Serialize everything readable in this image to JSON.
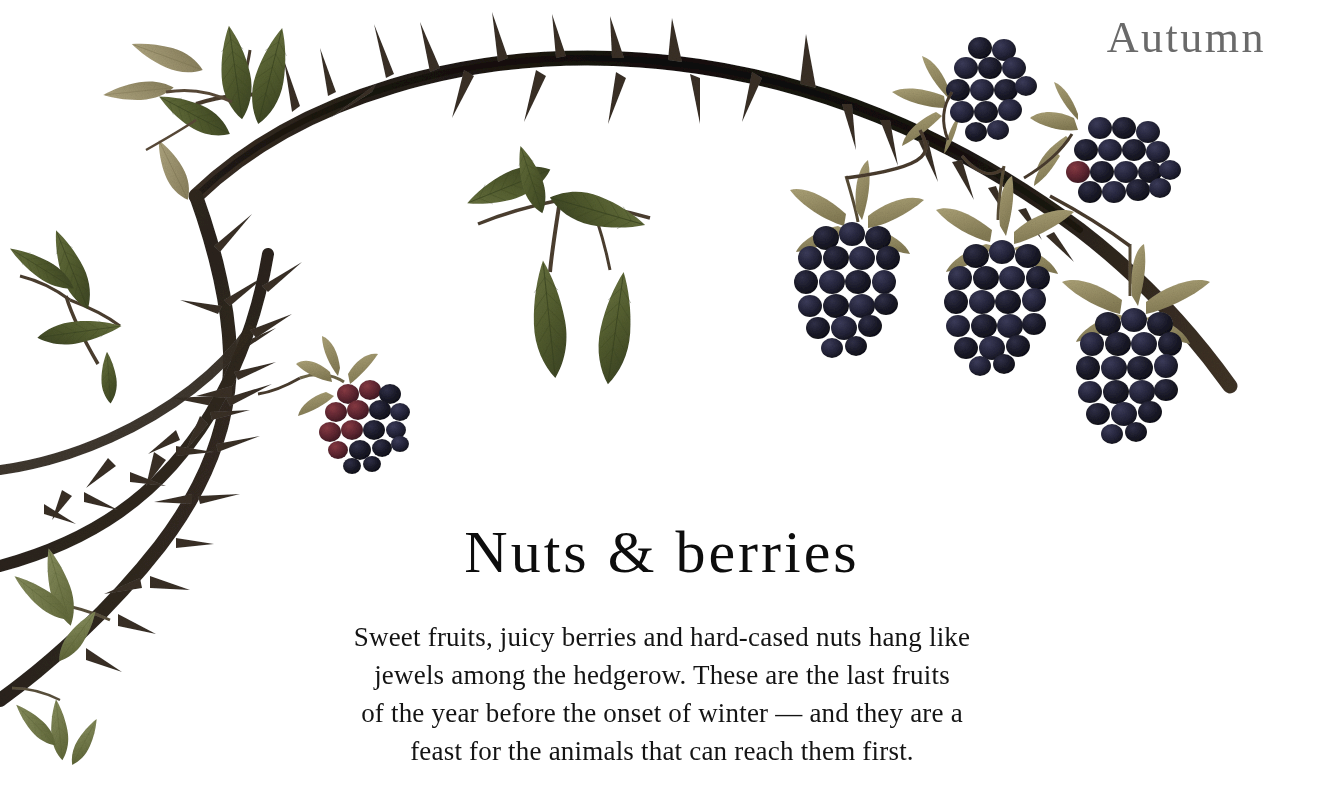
{
  "page": {
    "background_color": "#ffffff",
    "width": 1324,
    "height": 788
  },
  "season": {
    "label": "Autumn",
    "color": "#6a6a6a"
  },
  "caption": {
    "title": "Nuts & berries",
    "title_color": "#0d0d0d",
    "rule": "textured-hand-drawn-rule",
    "body_color": "#141414",
    "body_lines": [
      "Sweet fruits, juicy berries and hard-cased nuts hang like",
      "jewels among the hedgerow. These are the last fruits",
      "of the year before the onset of winter — and they are a",
      "feast for the animals that can reach them first."
    ]
  },
  "illustration": {
    "subject": "blackberry-bramble-cane",
    "description": "Pressed blackberry (Rubus fruticosus) cane arching across the top of the page with thorns, compound serrated leaves and clusters of ripe drupelet berries",
    "palette": {
      "cane_dark": "#2b241d",
      "cane_black": "#14110d",
      "cane_mid": "#4a3c2e",
      "thorn": "#3a3026",
      "leaf_green": "#5f6b3a",
      "leaf_green_dark": "#47512a",
      "leaf_green_light": "#7c8552",
      "leaf_dry": "#a59a72",
      "sepal_khaki": "#9c9269",
      "berry_black": "#16161f",
      "berry_blue_black": "#22223a",
      "berry_highlight": "#3c3c55",
      "berry_unripe_red": "#5a2430",
      "berry_unripe_maroon": "#7a3038"
    },
    "elements": [
      {
        "name": "main-arching-cane",
        "note": "thorny cane sweeping from lower left up over the top and down to the right"
      },
      {
        "name": "secondary-lower-cane",
        "note": "second thorny cane crossing down to the bottom left corner"
      },
      {
        "name": "leaf-cluster-top-left",
        "note": "mixed green and dried pale leaflets"
      },
      {
        "name": "leaf-cluster-center",
        "note": "five serrated green leaflets radiating from a petiole"
      },
      {
        "name": "leaf-cluster-left",
        "note": "three serrated olive leaflets"
      },
      {
        "name": "leaf-cluster-bottom-left",
        "note": "pale sage leaflets on the lower cane"
      },
      {
        "name": "berry-ripe-left",
        "note": "ripening berry, maroon turning black"
      },
      {
        "name": "berry-ripe-center",
        "note": "large black drupelet berry with khaki sepals"
      },
      {
        "name": "berry-ripe-right",
        "note": "large black drupelet berry with khaki sepals"
      },
      {
        "name": "berry-ripe-far-right",
        "note": "largest black drupelet berry with spreading sepals"
      },
      {
        "name": "berry-cluster-top",
        "note": "rounded cluster of dark drupelets near the top edge"
      },
      {
        "name": "berry-cluster-upper-right",
        "note": "flat oval cluster of dark drupelets"
      }
    ]
  }
}
